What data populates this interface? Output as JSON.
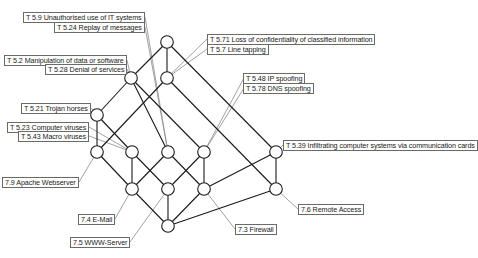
{
  "diagram": {
    "type": "concept-lattice",
    "colors": {
      "edge": "#1a1a1a",
      "leader": "#8a8a8a",
      "node_fill": "#ffffff",
      "node_stroke": "#1a1a1a",
      "label_border": "#6a6a6a"
    },
    "nodes": [
      {
        "id": "n0",
        "x": 167,
        "y": 42
      },
      {
        "id": "n1",
        "x": 131,
        "y": 78
      },
      {
        "id": "n2",
        "x": 167,
        "y": 78
      },
      {
        "id": "n3",
        "x": 97,
        "y": 115
      },
      {
        "id": "n4",
        "x": 97,
        "y": 152
      },
      {
        "id": "n5",
        "x": 132,
        "y": 152
      },
      {
        "id": "n6",
        "x": 168,
        "y": 152
      },
      {
        "id": "n7",
        "x": 204,
        "y": 152
      },
      {
        "id": "n8",
        "x": 276,
        "y": 152
      },
      {
        "id": "n9",
        "x": 132,
        "y": 189
      },
      {
        "id": "n10",
        "x": 168,
        "y": 189
      },
      {
        "id": "n11",
        "x": 204,
        "y": 189
      },
      {
        "id": "n12",
        "x": 276,
        "y": 189
      },
      {
        "id": "n13",
        "x": 168,
        "y": 226
      }
    ],
    "edges": [
      [
        "n0",
        "n1"
      ],
      [
        "n0",
        "n2"
      ],
      [
        "n0",
        "n8"
      ],
      [
        "n1",
        "n3"
      ],
      [
        "n1",
        "n6"
      ],
      [
        "n1",
        "n7"
      ],
      [
        "n2",
        "n4"
      ],
      [
        "n2",
        "n12"
      ],
      [
        "n3",
        "n4"
      ],
      [
        "n3",
        "n5"
      ],
      [
        "n4",
        "n9"
      ],
      [
        "n5",
        "n9"
      ],
      [
        "n5",
        "n10"
      ],
      [
        "n6",
        "n9"
      ],
      [
        "n6",
        "n11"
      ],
      [
        "n7",
        "n10"
      ],
      [
        "n7",
        "n11"
      ],
      [
        "n8",
        "n11"
      ],
      [
        "n8",
        "n12"
      ],
      [
        "n9",
        "n13"
      ],
      [
        "n10",
        "n13"
      ],
      [
        "n11",
        "n13"
      ],
      [
        "n12",
        "n13"
      ]
    ],
    "threat_labels": [
      {
        "text": "T 5.9 Unauthorised use of IT systems",
        "x": 37,
        "y": 12,
        "node": "n6",
        "ax": 145,
        "ay": 17
      },
      {
        "text": "T 5.24 Replay of messages",
        "x": 66,
        "y": 22,
        "node": "n6",
        "ax": 145,
        "ay": 27
      },
      {
        "text": "T 5.2 Manipulation of data or software",
        "x": 17,
        "y": 55,
        "node": "n1",
        "ax": 127,
        "ay": 60
      },
      {
        "text": "T 5.28 Denial of services",
        "x": 54,
        "y": 64,
        "node": "n1",
        "ax": 127,
        "ay": 69
      },
      {
        "text": "T 5.71 Loss of confidentiality of classified information",
        "x": 207,
        "y": 34,
        "node": "n2",
        "ax": 207,
        "ay": 39
      },
      {
        "text": "T 5.7 Line tapping",
        "x": 207,
        "y": 44,
        "node": "n2",
        "ax": 207,
        "ay": 49
      },
      {
        "text": "T 5.21 Trojan horses",
        "x": 31,
        "y": 103,
        "node": "n3",
        "ax": 91,
        "ay": 108
      },
      {
        "text": "T 5.23 Computer viruses",
        "x": 17,
        "y": 122,
        "node": "n5",
        "ax": 89,
        "ay": 127
      },
      {
        "text": "T 5.43 Macro viruses",
        "x": 29,
        "y": 131,
        "node": "n5",
        "ax": 89,
        "ay": 136
      },
      {
        "text": "T 5.48 IP spoofing",
        "x": 243,
        "y": 73,
        "node": "n7",
        "ax": 244,
        "ay": 78
      },
      {
        "text": "T 5.78 DNS spoofing",
        "x": 243,
        "y": 83,
        "node": "n7",
        "ax": 244,
        "ay": 88
      },
      {
        "text": "T 5.39 Infiltrating computer systems via communication cards",
        "x": 283,
        "y": 140,
        "node": "n8",
        "ax": 283,
        "ay": 145
      }
    ],
    "component_labels": [
      {
        "text": "7.9 Apache Webserver",
        "x": 11,
        "y": 177,
        "node": "n4",
        "ax": 79,
        "ay": 182
      },
      {
        "text": "7.4 E-Mail",
        "x": 84,
        "y": 214,
        "node": "n9",
        "ax": 115,
        "ay": 219
      },
      {
        "text": "7.5 WWW-Server",
        "x": 84,
        "y": 237,
        "node": "n10",
        "ax": 130,
        "ay": 242
      },
      {
        "text": "7.3 Firewall",
        "x": 235,
        "y": 224,
        "node": "n11",
        "ax": 235,
        "ay": 229
      },
      {
        "text": "7.6 Remote Access",
        "x": 298,
        "y": 204,
        "node": "n12",
        "ax": 298,
        "ay": 209
      }
    ]
  }
}
